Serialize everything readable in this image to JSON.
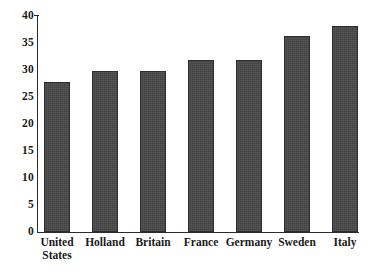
{
  "chart_data": {
    "type": "bar",
    "title": "",
    "subtitle": "",
    "xlabel": "",
    "ylabel": "",
    "categories": [
      "United\nStates",
      "Holland",
      "Britain",
      "France",
      "Germany",
      "Sweden",
      "Italy"
    ],
    "category_labels_flat": [
      "United States",
      "Holland",
      "Britain",
      "France",
      "Germany",
      "Sweden",
      "Italy"
    ],
    "values": [
      27.8,
      29.8,
      29.8,
      31.9,
      31.9,
      36.3,
      38.2
    ],
    "ylim": [
      0,
      40
    ],
    "yticks": [
      0,
      5,
      10,
      15,
      20,
      25,
      30,
      35,
      40
    ],
    "ytick_labels": [
      "0",
      "5",
      "10",
      "15",
      "20",
      "25",
      "30",
      "35",
      "40"
    ],
    "grid": false,
    "legend": null,
    "bar_color": "#474747",
    "bar_edge_color": "#2f2f2f",
    "axis_color": "#2b2b2b",
    "background_color": "#ffffff"
  }
}
